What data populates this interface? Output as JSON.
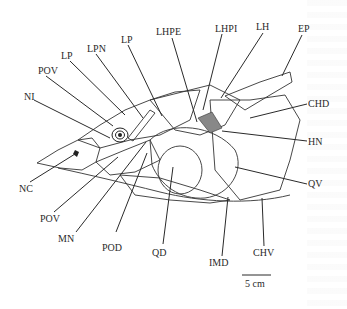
{
  "figure": {
    "labels": [
      {
        "id": "NI",
        "text": "NI"
      },
      {
        "id": "POV_top",
        "text": "POV"
      },
      {
        "id": "LP_left",
        "text": "LP"
      },
      {
        "id": "LPN",
        "text": "LPN"
      },
      {
        "id": "LP_right",
        "text": "LP"
      },
      {
        "id": "LHPE",
        "text": "LHPE"
      },
      {
        "id": "LHPI",
        "text": "LHPI"
      },
      {
        "id": "LH",
        "text": "LH"
      },
      {
        "id": "EP",
        "text": "EP"
      },
      {
        "id": "CHD",
        "text": "CHD"
      },
      {
        "id": "HN",
        "text": "HN"
      },
      {
        "id": "QV",
        "text": "QV"
      },
      {
        "id": "NC",
        "text": "NC"
      },
      {
        "id": "POV_bottom",
        "text": "POV"
      },
      {
        "id": "MN",
        "text": "MN"
      },
      {
        "id": "POD",
        "text": "POD"
      },
      {
        "id": "QD",
        "text": "QD"
      },
      {
        "id": "IMD",
        "text": "IMD"
      },
      {
        "id": "CHV",
        "text": "CHV"
      }
    ],
    "scale_bar": {
      "text": "5 cm"
    }
  }
}
